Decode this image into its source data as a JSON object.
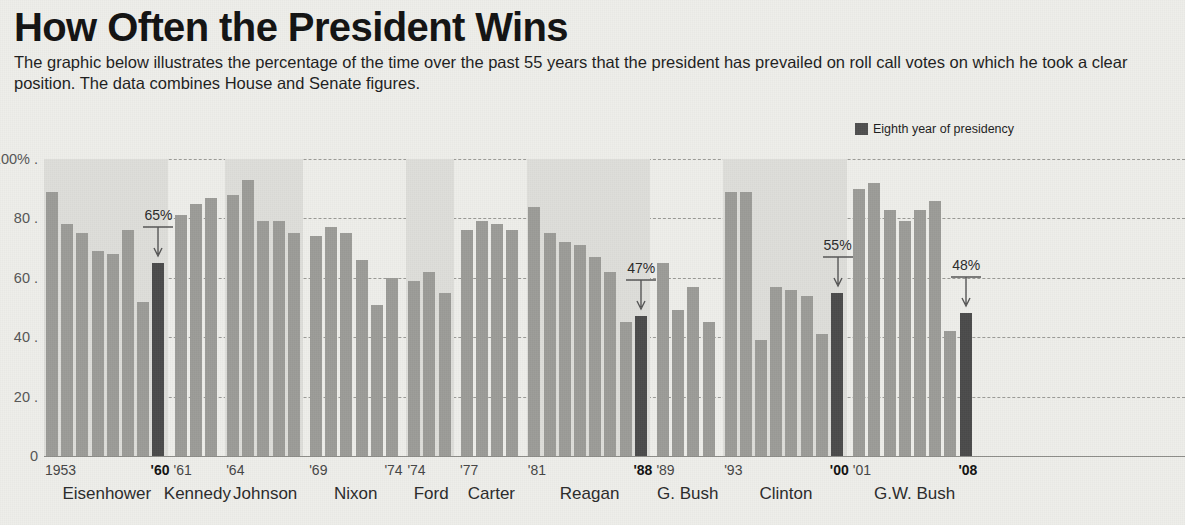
{
  "title": "How Often the President Wins",
  "deck": "The graphic below illustrates the percentage of the time over the past 55 years that the president has prevailed on roll call votes on which he took a clear position. The data combines House and Senate figures.",
  "legend": {
    "label": "Eighth year of presidency",
    "color": "#4b4b4b"
  },
  "colors": {
    "bar": "#9c9c98",
    "eighth_year_bar": "#4b4b4b",
    "band": "#dededa",
    "background": "#eeeeea",
    "grid": "#9a9a96"
  },
  "chart_data": {
    "type": "bar",
    "title": "How Often the President Wins",
    "xlabel": "",
    "ylabel": "Percent of roll call votes won",
    "ylim": [
      0,
      100
    ],
    "yticks": [
      "0",
      "20",
      "40",
      "60",
      "80",
      "100%"
    ],
    "grid": true,
    "legend_position": "top-right",
    "series_note": "Dark bars mark the eighth year of a presidency",
    "administrations": [
      {
        "name": "Eisenhower",
        "start_label": "1953",
        "end_label": "'60",
        "end_label_bold": true,
        "shaded": true,
        "values": [
          89,
          78,
          75,
          69,
          68,
          76,
          52,
          65
        ],
        "eighth_year_index": 7,
        "callout": {
          "text": "65%",
          "value": 65
        }
      },
      {
        "name": "Kennedy",
        "start_label": "'61",
        "end_label": "",
        "shaded": false,
        "values": [
          81,
          85,
          87
        ],
        "eighth_year_index": null,
        "callout": null
      },
      {
        "name": "Johnson",
        "start_label": "'64",
        "end_label": "",
        "shaded": true,
        "values": [
          88,
          93,
          79,
          79,
          75
        ],
        "eighth_year_index": null,
        "callout": null
      },
      {
        "name": "Nixon",
        "start_label": "'69",
        "end_label": "'74",
        "shaded": false,
        "values": [
          74,
          77,
          75,
          66,
          51,
          60
        ],
        "eighth_year_index": null,
        "callout": null
      },
      {
        "name": "Ford",
        "start_label": "'74",
        "end_label": "",
        "shaded": true,
        "values": [
          59,
          62,
          55
        ],
        "eighth_year_index": null,
        "callout": null
      },
      {
        "name": "Carter",
        "start_label": "'77",
        "end_label": "",
        "shaded": false,
        "values": [
          76,
          79,
          78,
          76
        ],
        "eighth_year_index": null,
        "callout": null
      },
      {
        "name": "Reagan",
        "start_label": "'81",
        "end_label": "'88",
        "end_label_bold": true,
        "shaded": true,
        "values": [
          84,
          75,
          72,
          71,
          67,
          62,
          45,
          47
        ],
        "eighth_year_index": 7,
        "callout": {
          "text": "47%",
          "value": 47
        }
      },
      {
        "name": "G. Bush",
        "start_label": "'89",
        "end_label": "",
        "shaded": false,
        "values": [
          65,
          49,
          57,
          45
        ],
        "eighth_year_index": null,
        "callout": null
      },
      {
        "name": "Clinton",
        "start_label": "'93",
        "end_label": "'00",
        "end_label_bold": true,
        "shaded": true,
        "values": [
          89,
          89,
          39,
          57,
          56,
          54,
          41,
          55
        ],
        "eighth_year_index": 7,
        "callout": {
          "text": "55%",
          "value": 55
        }
      },
      {
        "name": "G.W. Bush",
        "start_label": "'01",
        "end_label": "'08",
        "end_label_bold": true,
        "shaded": false,
        "values": [
          90,
          92,
          83,
          79,
          83,
          86,
          42,
          48
        ],
        "eighth_year_index": 7,
        "callout": {
          "text": "48%",
          "value": 48
        }
      }
    ]
  }
}
